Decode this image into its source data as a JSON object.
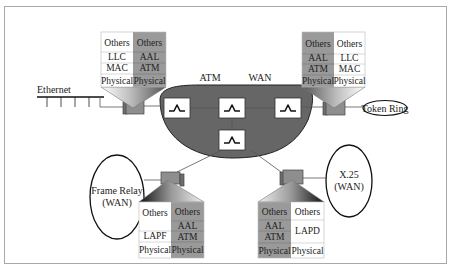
{
  "diagram": {
    "cloud": {
      "label_left": "ATM",
      "label_right": "WAN",
      "fill": "#666666"
    },
    "networks": {
      "ethernet": "Ethernet",
      "token_ring": "Token Ring",
      "frame_relay_line1": "Frame Relay",
      "frame_relay_line2": "(WAN)",
      "x25_line1": "X.25",
      "x25_line2": "(WAN)"
    },
    "stacks": {
      "top_left": {
        "left": [
          "Others",
          "LLC",
          "MAC",
          "Physical"
        ],
        "right": [
          "Others",
          "AAL",
          "ATM",
          "Physical"
        ]
      },
      "top_right": {
        "left": [
          "Others",
          "AAL",
          "ATM",
          "Physical"
        ],
        "right": [
          "Others",
          "LLC",
          "MAC",
          "Physical"
        ]
      },
      "bottom_left": {
        "left": [
          "Others",
          "LAPF",
          "Physical"
        ],
        "right": [
          "Others",
          "AAL",
          "ATM",
          "Physical"
        ]
      },
      "bottom_right": {
        "left": [
          "Others",
          "AAL",
          "ATM",
          "Physical"
        ],
        "right": [
          "Others",
          "LAPD",
          "Physical"
        ]
      }
    },
    "colors": {
      "ip_stack_gray": "#9a9a9a",
      "cloud_gray": "#666666",
      "frame_border": "#a8a8a8"
    }
  }
}
